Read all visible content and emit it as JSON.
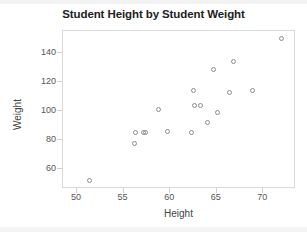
{
  "chart_data": {
    "type": "scatter",
    "title": "Student Height by Student Weight",
    "xlabel": "Height",
    "ylabel": "Weight",
    "xlim": [
      48.5,
      73.5
    ],
    "ylim": [
      46,
      155
    ],
    "xticks": [
      50,
      55,
      60,
      65,
      70
    ],
    "yticks": [
      60,
      80,
      100,
      120,
      140
    ],
    "grid": false,
    "legend": false,
    "marker": "open-circle",
    "marker_color": "#8d8d8d",
    "series": [
      {
        "name": "students",
        "x": [
          51.4,
          56.3,
          56.4,
          57.2,
          57.5,
          58.9,
          59.8,
          62.4,
          62.6,
          62.7,
          63.0,
          63.4,
          64.1,
          64.3,
          64.8,
          65.2,
          66.5,
          66.9,
          68.9,
          72.1
        ],
        "y": [
          51,
          77,
          84,
          84,
          84,
          100,
          85,
          84,
          113,
          103,
          103,
          103,
          91,
          85,
          128,
          98,
          112,
          133,
          113,
          149
        ],
        "points": [
          {
            "height": 51.4,
            "weight": 51
          },
          {
            "height": 56.3,
            "weight": 77
          },
          {
            "height": 56.4,
            "weight": 84
          },
          {
            "height": 57.2,
            "weight": 84
          },
          {
            "height": 57.5,
            "weight": 84
          },
          {
            "height": 58.9,
            "weight": 100
          },
          {
            "height": 59.8,
            "weight": 85
          },
          {
            "height": 62.4,
            "weight": 84
          },
          {
            "height": 62.6,
            "weight": 113
          },
          {
            "height": 62.7,
            "weight": 103
          },
          {
            "height": 63.4,
            "weight": 103
          },
          {
            "height": 64.1,
            "weight": 91
          },
          {
            "height": 64.8,
            "weight": 128
          },
          {
            "height": 65.2,
            "weight": 98
          },
          {
            "height": 66.5,
            "weight": 112
          },
          {
            "height": 66.9,
            "weight": 133
          },
          {
            "height": 68.9,
            "weight": 113
          },
          {
            "height": 72.1,
            "weight": 149
          }
        ]
      }
    ]
  },
  "axes": {
    "x_title": "Height",
    "y_title": "Weight",
    "x_tick_labels": [
      "50",
      "55",
      "60",
      "65",
      "70"
    ],
    "y_tick_labels": [
      "60",
      "80",
      "100",
      "120",
      "140"
    ]
  },
  "title": "Student Height by Student Weight"
}
